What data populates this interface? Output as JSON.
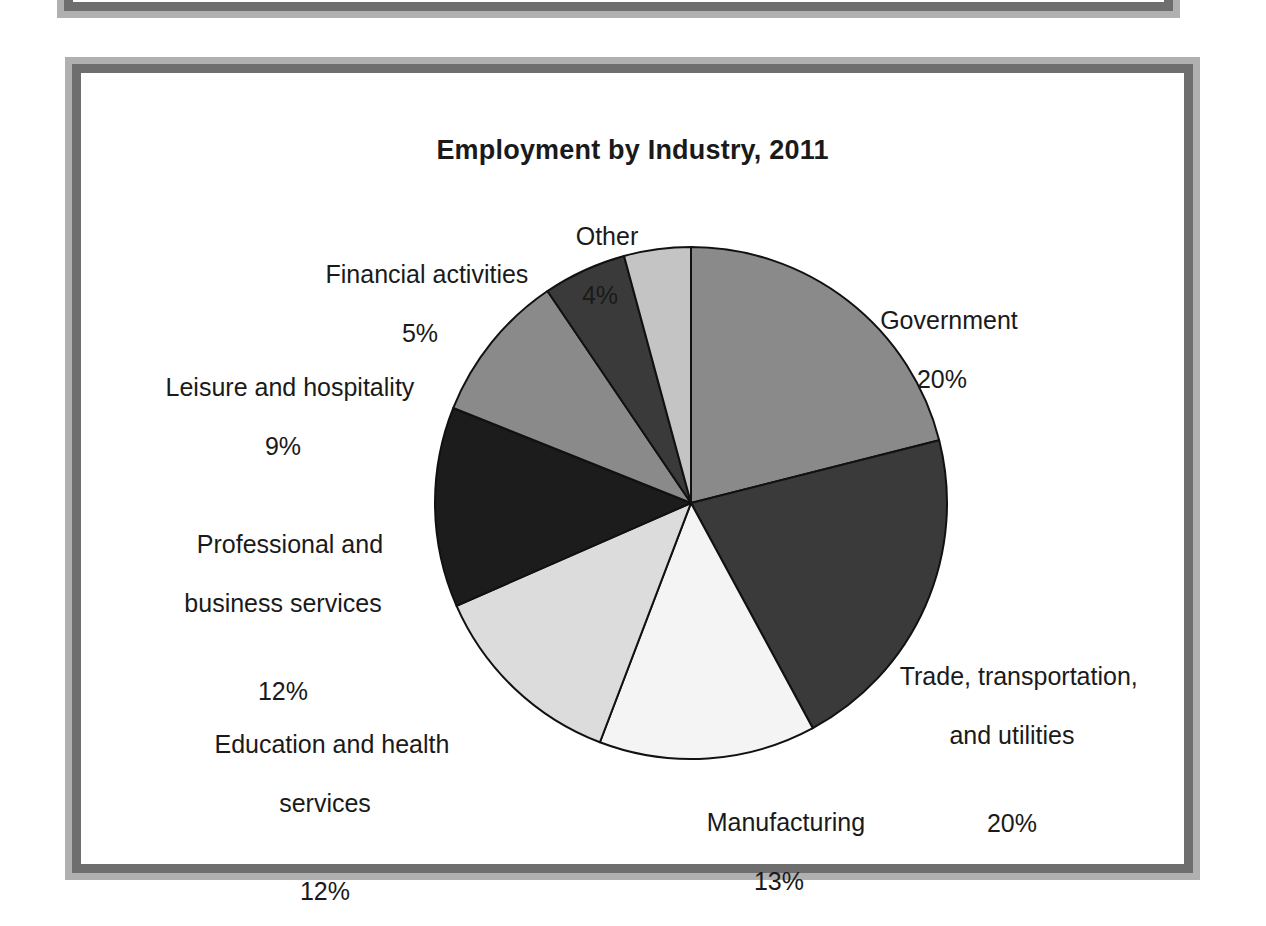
{
  "figure": {
    "title": "Employment by Industry, 2011"
  },
  "chart_data": {
    "type": "pie",
    "title": "Employment by Industry, 2011",
    "xlabel": "",
    "ylabel": "",
    "units": "percent",
    "legend_position": "none (labels placed around slices)",
    "grid": false,
    "start_angle_deg": 0,
    "direction": "clockwise",
    "categories": [
      "Government",
      "Trade, transportation, and utilities",
      "Manufacturing",
      "Education and health services",
      "Professional and business services",
      "Leisure and hospitality",
      "Financial activities",
      "Other"
    ],
    "values": [
      20,
      20,
      13,
      12,
      12,
      9,
      5,
      4
    ],
    "slices": [
      {
        "name": "government",
        "label": "Government",
        "percent_text": "20%",
        "value": 20,
        "color": "#8a8a8a"
      },
      {
        "name": "trade-transportation-utilities",
        "label_line1": "Trade, transportation,",
        "label_line2": "and utilities",
        "percent_text": "20%",
        "value": 20,
        "color": "#3a3a3a"
      },
      {
        "name": "manufacturing",
        "label": "Manufacturing",
        "percent_text": "13%",
        "value": 13,
        "color": "#f4f4f4"
      },
      {
        "name": "education-and-health-services",
        "label_line1": "Education and health",
        "label_line2": "services",
        "percent_text": "12%",
        "value": 12,
        "color": "#dcdcdc"
      },
      {
        "name": "professional-and-business-services",
        "label_line1": "Professional and",
        "label_line2": "business services",
        "percent_text": "12%",
        "value": 12,
        "color": "#1c1c1c"
      },
      {
        "name": "leisure-and-hospitality",
        "label": "Leisure and hospitality",
        "percent_text": "9%",
        "value": 9,
        "color": "#8a8a8a"
      },
      {
        "name": "financial-activities",
        "label": "Financial activities",
        "percent_text": "5%",
        "value": 5,
        "color": "#3a3a3a"
      },
      {
        "name": "other",
        "label": "Other",
        "percent_text": "4%",
        "value": 4,
        "color": "#c4c4c4"
      }
    ]
  }
}
